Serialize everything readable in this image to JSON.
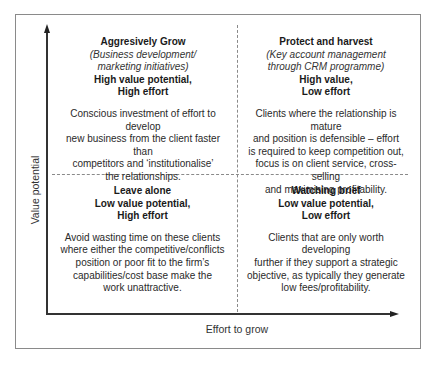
{
  "diagram": {
    "type": "2x2 matrix",
    "y_axis_label": "Value potential",
    "x_axis_label": "Effort to grow",
    "quadrants": {
      "top_left": {
        "title": "Aggresively Grow",
        "subtitle_lines": [
          "(Business development/",
          "marketing initiatives)"
        ],
        "meta_lines": [
          "High value potential,",
          "High effort"
        ],
        "description_lines": [
          "Conscious investment of effort to develop",
          "new business from the client faster than",
          "competitors and ‘institutionalise’",
          "the relationships."
        ]
      },
      "top_right": {
        "title": "Protect and harvest",
        "subtitle_lines": [
          "(Key account management",
          "through CRM programme)"
        ],
        "meta_lines": [
          "High value,",
          "Low effort"
        ],
        "description_lines": [
          "Clients where the relationship is mature",
          "and position is defensible – effort",
          "is required to keep competition out,",
          "focus is on client service, cross-selling",
          "and maximising profitability."
        ]
      },
      "bottom_left": {
        "title": "Leave alone",
        "meta_lines": [
          "Low value potential,",
          "High effort"
        ],
        "description_lines": [
          "Avoid wasting time on these clients",
          "where either the competitive/conflicts",
          "position or poor fit to the firm’s",
          "capabilities/cost base make the",
          "work unattractive."
        ]
      },
      "bottom_right": {
        "title": "Watching brief",
        "meta_lines": [
          "Low value potential,",
          "Low effort"
        ],
        "description_lines": [
          "Clients that are only worth developing",
          "further if they support a strategic",
          "objective, as typically they generate",
          "low fees/profitability."
        ]
      }
    },
    "colors": {
      "frame": "#8a8a8a",
      "axis": "#333333",
      "divider": "#8a8a8a",
      "text": "#1a1a1a"
    }
  }
}
